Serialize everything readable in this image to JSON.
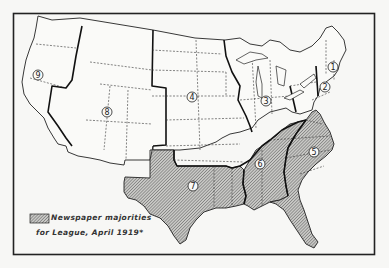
{
  "map": {
    "title": "",
    "legend": {
      "swatch_pattern": "diagonal-hatch",
      "line1": "Newspaper majorities",
      "line2": "for League, April 1919*"
    },
    "regions": [
      {
        "id": "1",
        "label": "1",
        "shaded": false
      },
      {
        "id": "2",
        "label": "2",
        "shaded": false
      },
      {
        "id": "3",
        "label": "3",
        "shaded": false
      },
      {
        "id": "4",
        "label": "4",
        "shaded": false
      },
      {
        "id": "5",
        "label": "5",
        "shaded": true
      },
      {
        "id": "6",
        "label": "6",
        "shaded": true
      },
      {
        "id": "7",
        "label": "7",
        "shaded": true
      },
      {
        "id": "8",
        "label": "8",
        "shaded": false
      },
      {
        "id": "9",
        "label": "9",
        "shaded": false
      }
    ],
    "colors": {
      "ink": "#222222",
      "paper": "#f7f7f5",
      "hatch": "#555555"
    }
  }
}
